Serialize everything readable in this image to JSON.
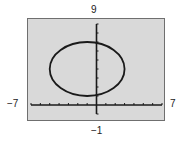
{
  "chart_data": {
    "type": "line",
    "title": "",
    "xlabel": "",
    "ylabel": "",
    "xlim": [
      -7,
      7
    ],
    "ylim": [
      -1,
      9
    ],
    "window_labels": {
      "xmin": "−7",
      "xmax": "7",
      "ymin": "−1",
      "ymax": "9"
    },
    "x_ticks": [
      -7,
      -6,
      -5,
      -4,
      -3,
      -2,
      -1,
      0,
      1,
      2,
      3,
      4,
      5,
      6,
      7
    ],
    "y_ticks": [
      -1,
      0,
      1,
      2,
      3,
      4,
      5,
      6,
      7,
      8,
      9
    ],
    "grid": false,
    "legend": null,
    "series": [
      {
        "name": "ellipse",
        "shape": "ellipse",
        "center": [
          -1,
          4
        ],
        "semi_axis_x": 4,
        "semi_axis_y": 3,
        "equation": "(x+1)^2/16 + (y-4)^2/9 = 1"
      }
    ]
  },
  "colors": {
    "screen_background": "#d9d9d9",
    "frame": "#6f6f6f",
    "axes": "#1a1a1a",
    "curve": "#1a1a1a",
    "label": "#222222"
  }
}
